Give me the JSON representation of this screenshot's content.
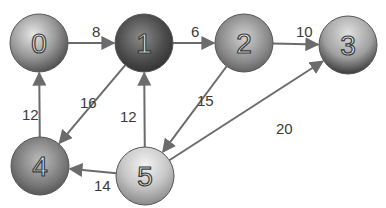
{
  "nodes": [
    {
      "id": "0",
      "label": "0",
      "scene": "hillside village"
    },
    {
      "id": "1",
      "label": "1",
      "scene": "pagoda temple"
    },
    {
      "id": "2",
      "label": "2",
      "scene": "old town buildings"
    },
    {
      "id": "3",
      "label": "3",
      "scene": "stone bridge"
    },
    {
      "id": "4",
      "label": "4",
      "scene": "palace"
    },
    {
      "id": "5",
      "label": "5",
      "scene": "beach"
    }
  ],
  "edges": [
    {
      "from": "0",
      "to": "1",
      "weight": "8"
    },
    {
      "from": "1",
      "to": "2",
      "weight": "6"
    },
    {
      "from": "2",
      "to": "3",
      "weight": "10"
    },
    {
      "from": "4",
      "to": "0",
      "weight": "12"
    },
    {
      "from": "1",
      "to": "4",
      "weight": "16"
    },
    {
      "from": "5",
      "to": "1",
      "weight": "12"
    },
    {
      "from": "2",
      "to": "5",
      "weight": "15"
    },
    {
      "from": "5",
      "to": "3",
      "weight": "20"
    },
    {
      "from": "5",
      "to": "4",
      "weight": "14"
    }
  ]
}
